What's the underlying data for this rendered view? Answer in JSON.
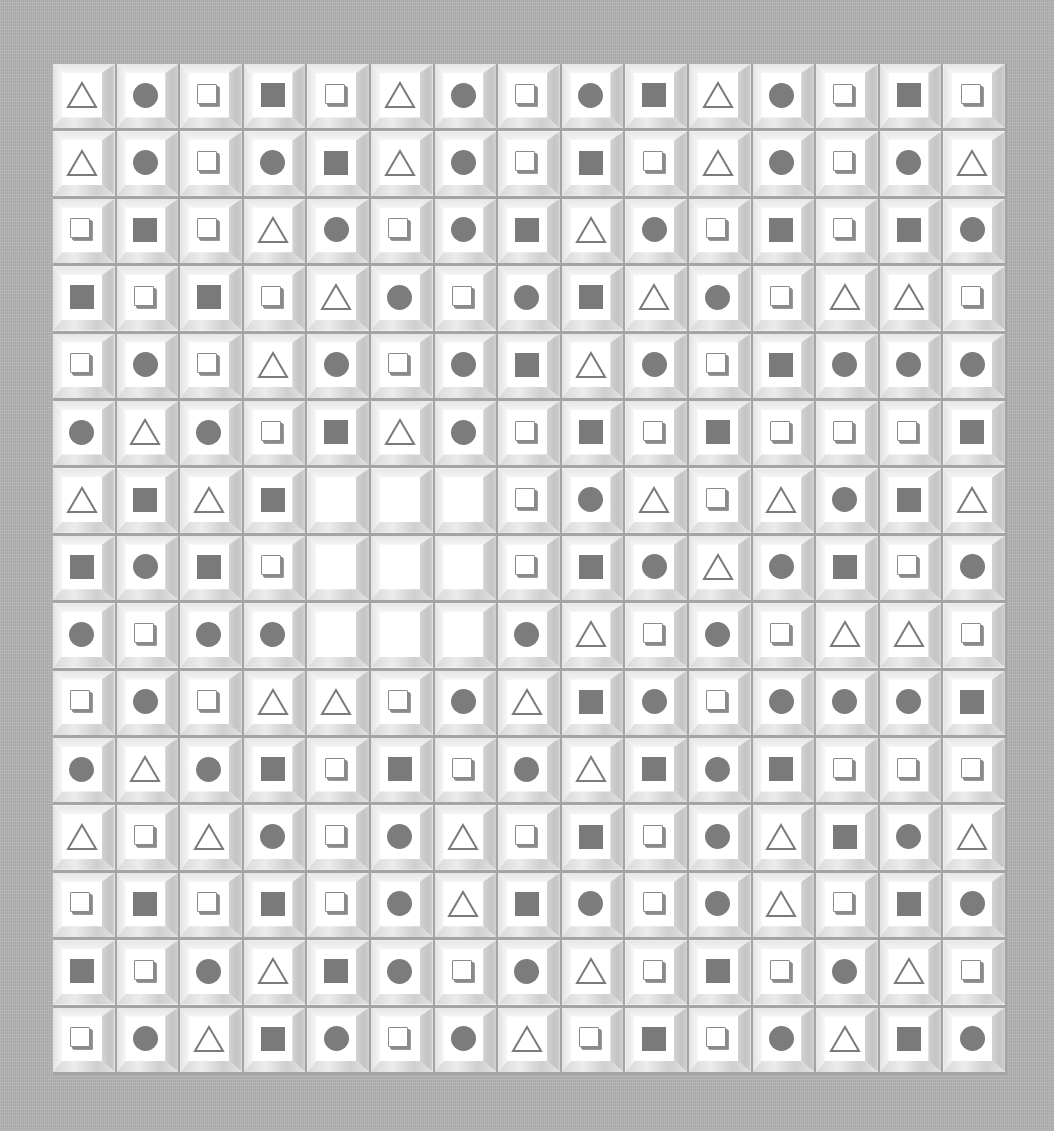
{
  "board": {
    "rows": 15,
    "cols": 15,
    "legend": {
      "T": "triangle",
      "C": "circle",
      "B": "box",
      "S": "square",
      "E": "empty"
    },
    "colors": {
      "background": "#b3b3b3",
      "tile_face": "#ffffff",
      "symbol_fill": "#7a7a7a",
      "groove": "#a4a4a4"
    },
    "empty_region": {
      "row_start": 7,
      "row_end": 9,
      "col_start": 5,
      "col_end": 7
    },
    "grid": [
      [
        "T",
        "C",
        "B",
        "S",
        "B",
        "T",
        "C",
        "B",
        "C",
        "S",
        "T",
        "C",
        "B",
        "S",
        "B"
      ],
      [
        "T",
        "C",
        "B",
        "C",
        "S",
        "T",
        "C",
        "B",
        "S",
        "B",
        "T",
        "C",
        "B",
        "C",
        "T"
      ],
      [
        "B",
        "S",
        "B",
        "T",
        "C",
        "B",
        "C",
        "S",
        "T",
        "C",
        "B",
        "S",
        "B",
        "S",
        "C"
      ],
      [
        "S",
        "B",
        "S",
        "B",
        "T",
        "C",
        "B",
        "C",
        "S",
        "T",
        "C",
        "B",
        "T",
        "T",
        "B"
      ],
      [
        "B",
        "C",
        "B",
        "T",
        "C",
        "B",
        "C",
        "S",
        "T",
        "C",
        "B",
        "S",
        "C",
        "C",
        "C"
      ],
      [
        "C",
        "T",
        "C",
        "B",
        "S",
        "T",
        "C",
        "B",
        "S",
        "B",
        "S",
        "B",
        "B",
        "B",
        "S"
      ],
      [
        "T",
        "S",
        "T",
        "S",
        "E",
        "E",
        "E",
        "B",
        "C",
        "T",
        "B",
        "T",
        "C",
        "S",
        "T"
      ],
      [
        "S",
        "C",
        "S",
        "B",
        "E",
        "E",
        "E",
        "B",
        "S",
        "C",
        "T",
        "C",
        "S",
        "B",
        "C"
      ],
      [
        "C",
        "B",
        "C",
        "C",
        "E",
        "E",
        "E",
        "C",
        "T",
        "B",
        "C",
        "B",
        "T",
        "T",
        "B"
      ],
      [
        "B",
        "C",
        "B",
        "T",
        "T",
        "B",
        "C",
        "T",
        "S",
        "C",
        "B",
        "C",
        "C",
        "C",
        "S"
      ],
      [
        "C",
        "T",
        "C",
        "S",
        "B",
        "S",
        "B",
        "C",
        "T",
        "S",
        "C",
        "S",
        "B",
        "B",
        "B"
      ],
      [
        "T",
        "B",
        "T",
        "C",
        "B",
        "C",
        "T",
        "B",
        "S",
        "B",
        "C",
        "T",
        "S",
        "C",
        "T"
      ],
      [
        "B",
        "S",
        "B",
        "S",
        "B",
        "C",
        "T",
        "S",
        "C",
        "B",
        "C",
        "T",
        "B",
        "S",
        "C"
      ],
      [
        "S",
        "B",
        "C",
        "T",
        "S",
        "C",
        "B",
        "C",
        "T",
        "B",
        "S",
        "B",
        "C",
        "T",
        "B"
      ],
      [
        "B",
        "C",
        "T",
        "S",
        "C",
        "B",
        "C",
        "T",
        "B",
        "S",
        "B",
        "C",
        "T",
        "S",
        "C"
      ]
    ]
  }
}
